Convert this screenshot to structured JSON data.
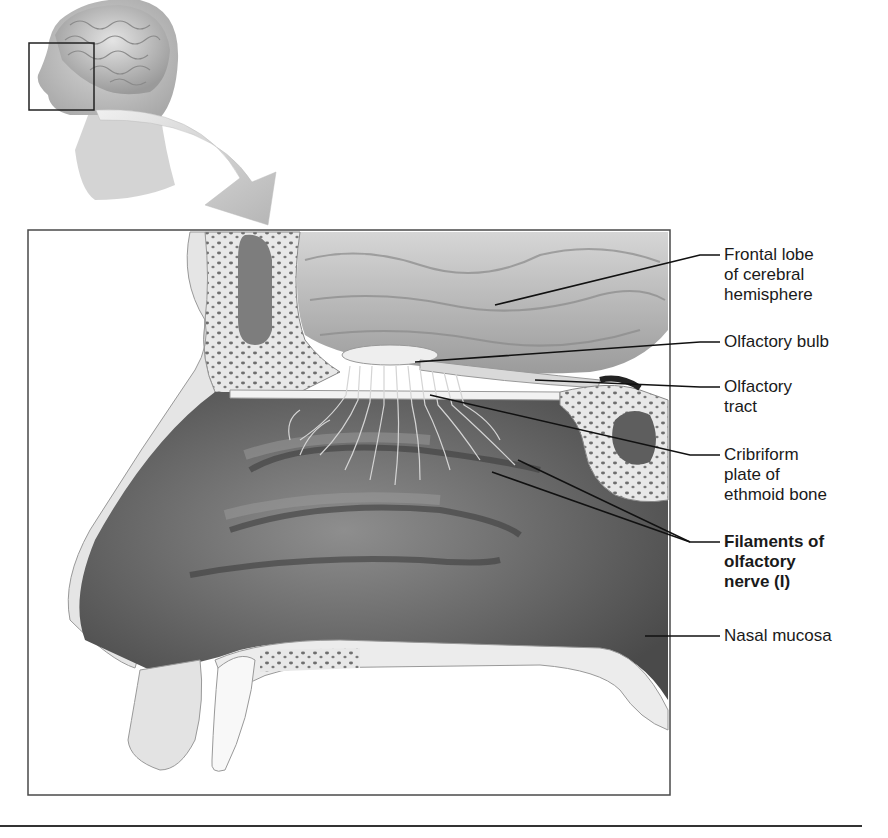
{
  "figure": {
    "inset": {
      "description": "Head in profile with brain visible; box marks nasal region enlarged below",
      "arrow": "curved arrow from inset to enlarged view"
    },
    "labels": [
      {
        "id": "frontal-lobe",
        "text": "Frontal lobe\nof cerebral\nhemisphere",
        "bold": false
      },
      {
        "id": "olfactory-bulb",
        "text": "Olfactory bulb",
        "bold": false
      },
      {
        "id": "olfactory-tract",
        "text": "Olfactory\ntract",
        "bold": false
      },
      {
        "id": "cribriform-plate",
        "text": "Cribriform\nplate of\nethmoid bone",
        "bold": false
      },
      {
        "id": "filaments-olfactory-nerve",
        "text": "Filaments of\nolfactory\nnerve (I)",
        "bold": true
      },
      {
        "id": "nasal-mucosa",
        "text": "Nasal mucosa",
        "bold": false
      }
    ]
  },
  "colors": {
    "background": "#ffffff",
    "frame": "#4a4a4a",
    "bone": "#e6e6e6",
    "cavity_dark": "#5a5a5a",
    "brain": "#c8c8c8",
    "leader": "#111111"
  }
}
